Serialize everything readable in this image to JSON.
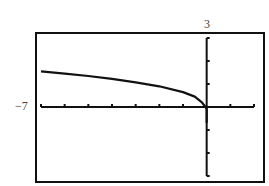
{
  "chart_data": {
    "type": "line",
    "title": "",
    "xlabel": "",
    "ylabel": "",
    "window": {
      "xmin": -7,
      "xmax": 2,
      "xscl": 1,
      "ymin": -3,
      "ymax": 3,
      "yscl": 1
    },
    "xlim": [
      -7,
      2
    ],
    "ylim": [
      -3,
      3
    ],
    "grid": false,
    "legend": null,
    "tick_labels": {
      "x_left": "−7",
      "y_top": "3"
    },
    "series": [
      {
        "name": "f(x)",
        "x": [
          -7,
          -6,
          -5,
          -4,
          -3,
          -2,
          -1,
          -0.5,
          -0.2,
          -0.05,
          0,
          0
        ],
        "y": [
          1.55,
          1.45,
          1.35,
          1.22,
          1.07,
          0.9,
          0.65,
          0.45,
          0.2,
          0.0,
          -0.1,
          -0.7
        ]
      }
    ],
    "colors": {
      "axis": "#111111",
      "curve": "#111111",
      "frame": "#111111",
      "background": "#ffffff"
    }
  },
  "labels": {
    "xmin": "−7",
    "ymax": "3"
  }
}
